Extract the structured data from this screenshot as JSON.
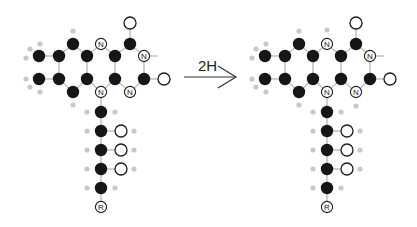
{
  "reaction": {
    "arrow_label": "2H",
    "reactant": {
      "name": "oxidized-flavin",
      "chain_end_label": "R",
      "n_label": "N"
    },
    "product": {
      "name": "reduced-flavin",
      "chain_end_label": "R",
      "n_label": "N"
    }
  },
  "colors": {
    "carbon": "#161616",
    "hydrogen": "#c8c8c8",
    "oxygen_outline": "#1c1c1c",
    "bond": "#c4c4c4"
  }
}
